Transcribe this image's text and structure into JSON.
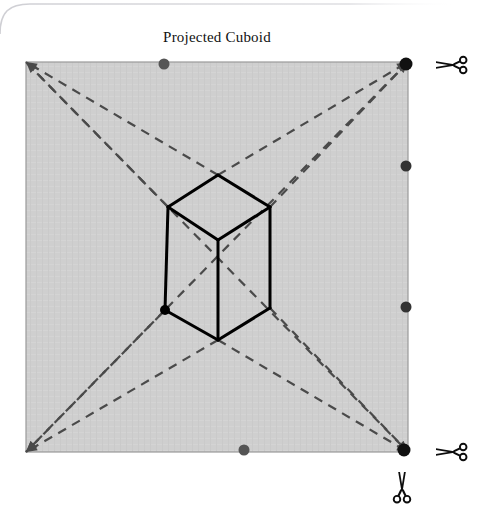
{
  "page": {
    "background_color": "#ffffff",
    "width": 484,
    "height": 520,
    "card_edge_color": "#d7d7da"
  },
  "figure": {
    "title": "Projected Cuboid",
    "title_color": "#111111",
    "sheet": {
      "name": "projection-sheet",
      "fill_color": "#cfcfcf",
      "border_color": "#9a9a9a",
      "x": 26,
      "y": 62,
      "width": 382,
      "height": 390
    },
    "diagonals": {
      "name": "projection-rays",
      "color": "#4a4a4a",
      "dash": "9,7",
      "width": 2.2,
      "vanishing_points": [
        {
          "x": 218,
          "y": 175
        },
        {
          "x": 218,
          "y": 340
        },
        {
          "x": 168,
          "y": 207
        },
        {
          "x": 270,
          "y": 207
        },
        {
          "x": 165,
          "y": 310
        },
        {
          "x": 270,
          "y": 308
        }
      ],
      "rays": [
        {
          "from_x": 218,
          "from_y": 175,
          "to_x": 26,
          "to_y": 62
        },
        {
          "from_x": 218,
          "from_y": 175,
          "to_x": 408,
          "to_y": 62
        },
        {
          "from_x": 218,
          "from_y": 340,
          "to_x": 26,
          "to_y": 452
        },
        {
          "from_x": 218,
          "from_y": 340,
          "to_x": 408,
          "to_y": 452
        },
        {
          "from_x": 168,
          "from_y": 207,
          "to_x": 26,
          "to_y": 62
        },
        {
          "from_x": 270,
          "from_y": 207,
          "to_x": 408,
          "to_y": 62
        },
        {
          "from_x": 165,
          "from_y": 310,
          "to_x": 26,
          "to_y": 452
        },
        {
          "from_x": 270,
          "from_y": 308,
          "to_x": 408,
          "to_y": 452
        },
        {
          "from_x": 26,
          "from_y": 62,
          "to_x": 408,
          "to_y": 452
        },
        {
          "from_x": 408,
          "from_y": 62,
          "to_x": 26,
          "to_y": 452
        }
      ]
    },
    "cuboid": {
      "name": "projected-cuboid",
      "stroke_color": "#000000",
      "stroke_width": 3,
      "face_fill": "none",
      "vertices": {
        "top_back": {
          "x": 218,
          "y": 175
        },
        "top_left": {
          "x": 168,
          "y": 207
        },
        "top_right": {
          "x": 270,
          "y": 207
        },
        "top_front": {
          "x": 218,
          "y": 240
        },
        "bottom_left": {
          "x": 165,
          "y": 310
        },
        "bottom_right": {
          "x": 270,
          "y": 308
        },
        "bottom_front": {
          "x": 218,
          "y": 340
        }
      }
    },
    "markers": [
      {
        "name": "marker-top-edge",
        "x": 164,
        "y": 64,
        "r": 5.5,
        "color": "#555555"
      },
      {
        "name": "marker-top-right-corner",
        "x": 406,
        "y": 64,
        "r": 6.5,
        "color": "#111111"
      },
      {
        "name": "marker-right-edge-upper",
        "x": 406,
        "y": 166,
        "r": 5.5,
        "color": "#333333"
      },
      {
        "name": "marker-right-edge-lower",
        "x": 406,
        "y": 307,
        "r": 5.5,
        "color": "#333333"
      },
      {
        "name": "marker-bottom-edge",
        "x": 244,
        "y": 450,
        "r": 5.5,
        "color": "#555555"
      },
      {
        "name": "marker-bottom-right-corner",
        "x": 404,
        "y": 450,
        "r": 6.5,
        "color": "#111111"
      },
      {
        "name": "marker-cuboid-bottom-left",
        "x": 165,
        "y": 310,
        "r": 5.0,
        "color": "#000000"
      }
    ]
  },
  "cut_guides": [
    {
      "name": "scissors-top-right",
      "orientation": "horizontal",
      "x": 452,
      "y": 65
    },
    {
      "name": "scissors-bottom-right",
      "orientation": "horizontal",
      "x": 452,
      "y": 452
    },
    {
      "name": "scissors-bottom",
      "orientation": "vertical",
      "x": 402,
      "y": 488
    }
  ],
  "icons": {
    "scissors": "scissors-icon"
  }
}
